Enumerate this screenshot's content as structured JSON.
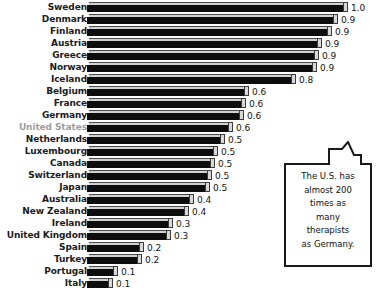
{
  "chart_data": {
    "type": "bar",
    "orientation": "horizontal",
    "title": "",
    "subtitle": "",
    "xlabel": "",
    "ylabel": "",
    "grid": false,
    "legend": "none",
    "xlim": [
      0,
      1.0
    ],
    "categories": [
      "Sweden",
      "Denmark",
      "Finland",
      "Austria",
      "Greece",
      "Norway",
      "Iceland",
      "Belgium",
      "France",
      "Germany",
      "United States",
      "Netherlands",
      "Luxembourg",
      "Canada",
      "Switzerland",
      "Japan",
      "Australia",
      "New Zealand",
      "Ireland",
      "United Kingdom",
      "Spain",
      "Turkey",
      "Portugal",
      "Italy"
    ],
    "values": [
      1.0,
      0.96,
      0.94,
      0.9,
      0.89,
      0.88,
      0.8,
      0.62,
      0.61,
      0.6,
      0.56,
      0.53,
      0.5,
      0.49,
      0.48,
      0.47,
      0.41,
      0.39,
      0.33,
      0.32,
      0.22,
      0.21,
      0.12,
      0.1
    ],
    "value_labels": [
      "1.0",
      "0.9",
      "0.9",
      "0.9",
      "0.9",
      "0.9",
      "0.8",
      "0.6",
      "0.6",
      "0.6",
      "0.6",
      "0.5",
      "0.5",
      "0.5",
      "0.5",
      "0.5",
      "0.4",
      "0.4",
      "0.3",
      "0.3",
      "0.2",
      "0.2",
      "0.1",
      "0.1"
    ],
    "highlight_category": "United States",
    "colors": {
      "bar_body": "#0d0d0d",
      "bar_top": "#d2d2d2",
      "bar_cap": "#d8d8d8",
      "label": "#1b1b1b",
      "label_highlight": "#9d9d9d",
      "value_label": "#141414",
      "background": "#ffffff",
      "callout_border": "#1a1a1a"
    },
    "annotations": [
      {
        "name": "us-vs-germany-callout",
        "text": "The U.S. has almost 200 times as many therapists as Germany.",
        "lines": [
          "The U.S. has",
          "almost 200",
          "times as",
          "many",
          "therapists",
          "as Germany."
        ],
        "points_to": "Germany"
      }
    ]
  }
}
